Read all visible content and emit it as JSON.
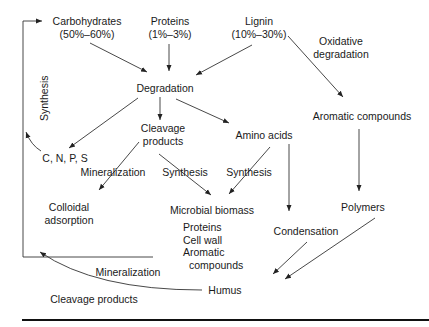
{
  "diagram": {
    "nodes": {
      "carbohydrates": {
        "label": "Carbohydrates",
        "share": "(50%–60%)"
      },
      "proteins": {
        "label": "Proteins",
        "share": "(1%–3%)"
      },
      "lignin": {
        "label": "Lignin",
        "share": "(10%–30%)"
      },
      "degradation": {
        "label": "Degradation"
      },
      "cleavage_products": {
        "line1": "Cleavage",
        "line2": "products"
      },
      "amino_acids": {
        "label": "Amino acids"
      },
      "aromatic_compounds": {
        "label": "Aromatic compounds"
      },
      "cnps": {
        "label": "C, N, P, S"
      },
      "colloidal_adsorption": {
        "line1": "Colloidal",
        "line2": "adsorption"
      },
      "microbial_biomass": {
        "label": "Microbial biomass",
        "items": [
          "Proteins",
          "Cell wall",
          "Aromatic",
          "compounds"
        ]
      },
      "polymers": {
        "label": "Polymers"
      },
      "condensation": {
        "label": "Condensation"
      },
      "humus": {
        "label": "Humus"
      },
      "cleavage_products_bottom": {
        "label": "Cleavage products"
      }
    },
    "edge_labels": {
      "oxidative_degradation": {
        "line1": "Oxidative",
        "line2": "degradation"
      },
      "synthesis_loop": "Synthesis",
      "mineralization_cleavage": "Mineralization",
      "synthesis_cleavage": "Synthesis",
      "synthesis_amino": "Synthesis",
      "mineralization_humus": "Mineralization"
    }
  }
}
